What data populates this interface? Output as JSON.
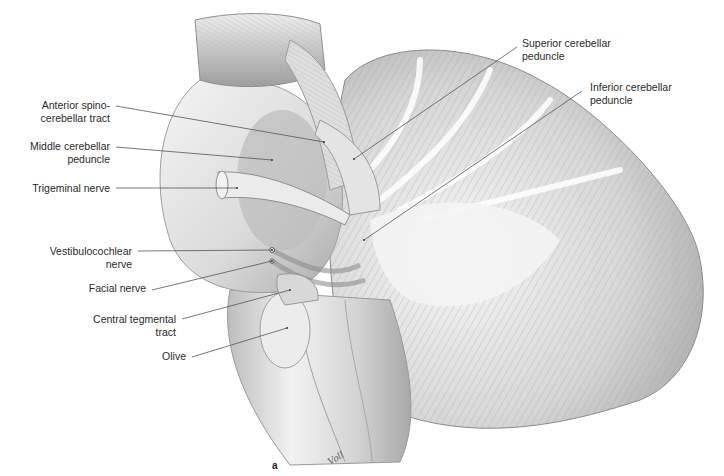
{
  "figure": {
    "panel_letter": "a",
    "signature": "Voll",
    "labels": [
      {
        "id": "anterior-spinocerebellar-tract",
        "lines": [
          "Anterior spino-",
          "cerebellar tract"
        ],
        "side": "left",
        "x": 24,
        "y": 99,
        "anchor": [
          324,
          142
        ],
        "from": [
          116,
          106
        ]
      },
      {
        "id": "middle-cerebellar-peduncle",
        "lines": [
          "Middle cerebellar",
          "peduncle"
        ],
        "side": "left",
        "x": 24,
        "y": 140,
        "anchor": [
          272,
          160
        ],
        "from": [
          116,
          147
        ]
      },
      {
        "id": "trigeminal-nerve",
        "lines": [
          "Trigeminal nerve"
        ],
        "side": "left",
        "x": 24,
        "y": 182,
        "anchor": [
          237,
          188
        ],
        "from": [
          116,
          188
        ]
      },
      {
        "id": "vestibulocochlear-nerve",
        "lines": [
          "Vestibulocochlear",
          "nerve"
        ],
        "side": "left",
        "x": 24,
        "y": 245,
        "anchor": [
          272,
          250
        ],
        "from": [
          138,
          251
        ]
      },
      {
        "id": "facial-nerve",
        "lines": [
          "Facial nerve"
        ],
        "side": "left",
        "x": 24,
        "y": 282,
        "anchor": [
          272,
          261
        ],
        "from": [
          152,
          290
        ]
      },
      {
        "id": "central-tegmental-tract",
        "lines": [
          "Central tegmental",
          "tract"
        ],
        "side": "left",
        "x": 24,
        "y": 313,
        "anchor": [
          290,
          290
        ],
        "from": [
          182,
          319
        ]
      },
      {
        "id": "olive",
        "lines": [
          "Olive"
        ],
        "side": "left",
        "x": 24,
        "y": 350,
        "anchor": [
          287,
          328
        ],
        "from": [
          192,
          357
        ]
      },
      {
        "id": "superior-cerebellar-peduncle",
        "lines": [
          "Superior cerebellar",
          "peduncle"
        ],
        "side": "right",
        "x": 522,
        "y": 37,
        "anchor": [
          354,
          159
        ],
        "from": [
          517,
          47
        ]
      },
      {
        "id": "inferior-cerebellar-peduncle",
        "lines": [
          "Inferior cerebellar",
          "peduncle"
        ],
        "side": "right",
        "x": 590,
        "y": 81,
        "anchor": [
          364,
          240
        ],
        "from": [
          582,
          91
        ]
      }
    ]
  },
  "colors": {
    "background": "#ffffff",
    "text": "#2a2a2a",
    "leader_line": "#555555",
    "tissue_light": "#e8e8e8",
    "tissue_mid": "#c8c8c8",
    "tissue_dark": "#9a9a9a"
  }
}
